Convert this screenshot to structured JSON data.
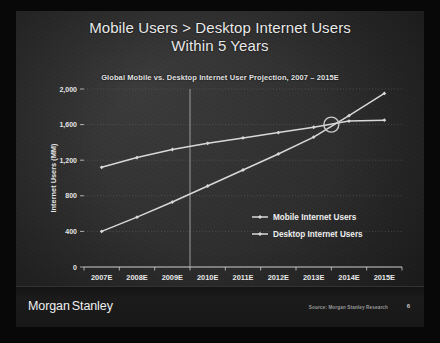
{
  "slide": {
    "title_line_1": "Mobile Users > Desktop Internet Users",
    "title_line_2": "Within 5 Years",
    "page_number": "6",
    "brand_primary": "Morgan",
    "brand_secondary": "Stanley",
    "source_note": "Source: Morgan Stanley Research"
  },
  "colors": {
    "slide_background": "#2e2e2e",
    "frame": "#080808",
    "title_text": "#e9e9e9",
    "series_line": "#d8d8d8",
    "gridline": "#6e6e6e",
    "axis": "#cfcfcf",
    "highlight_circle": "#c9c9c9",
    "footer_band": "#181818"
  },
  "chart_data": {
    "type": "line",
    "title": "Global Mobile vs. Desktop Internet User Projection, 2007 – 2015E",
    "xlabel": "",
    "ylabel": "Internet Users (MM)",
    "categories": [
      "2007E",
      "2008E",
      "2009E",
      "2010E",
      "2011E",
      "2012E",
      "2013E",
      "2014E",
      "2015E"
    ],
    "ylim": [
      0,
      2000
    ],
    "yticks": [
      0,
      400,
      800,
      1200,
      1600,
      2000
    ],
    "ytick_labels": [
      "0",
      "400",
      "800",
      "1,200",
      "1,600",
      "2,000"
    ],
    "grid": true,
    "legend_position": "inside-center-right",
    "series": [
      {
        "name": "Mobile Internet Users",
        "values": [
          400,
          560,
          730,
          910,
          1090,
          1270,
          1460,
          1700,
          1950
        ]
      },
      {
        "name": "Desktop Internet Users",
        "values": [
          1120,
          1230,
          1320,
          1390,
          1450,
          1510,
          1570,
          1640,
          1650
        ]
      }
    ],
    "annotations": [
      {
        "name": "crossover-highlight",
        "type": "circle",
        "x_between": [
          "2013E",
          "2014E"
        ],
        "y_value": 1600,
        "label": ""
      },
      {
        "name": "actual-estimate-divider",
        "type": "vline",
        "x_between": [
          "2009E",
          "2010E"
        ],
        "label": ""
      }
    ]
  }
}
